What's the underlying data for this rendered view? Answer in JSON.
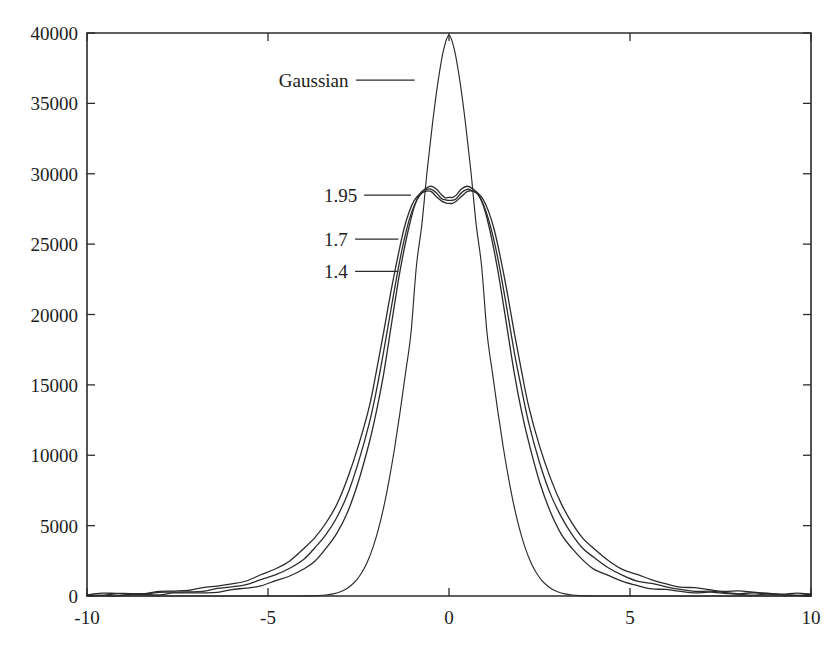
{
  "chart_data": {
    "type": "line",
    "title": "",
    "subtitle": "",
    "xlabel": "",
    "ylabel": "",
    "xlim": [
      -10,
      10
    ],
    "ylim": [
      0,
      40000
    ],
    "grid": false,
    "legend_position": "inline-annotations",
    "xticks": [
      -10,
      -5,
      0,
      5,
      10
    ],
    "xtick_labels": [
      "-10",
      "-5",
      "0",
      "5",
      "10"
    ],
    "yticks": [
      0,
      5000,
      10000,
      15000,
      20000,
      25000,
      30000,
      35000,
      40000
    ],
    "ytick_labels": [
      "0",
      "5000",
      "10000",
      "15000",
      "20000",
      "25000",
      "30000",
      "35000",
      "40000"
    ],
    "annotations": [
      {
        "text": "Gaussian",
        "label_x": -4.7,
        "label_y": 36650,
        "leader_to_x": -0.95,
        "leader_to_y": 36650
      },
      {
        "text": "1.95",
        "label_x": -3.45,
        "label_y": 28480,
        "leader_to_x": -1.05,
        "leader_to_y": 28480
      },
      {
        "text": "1.7",
        "label_x": -3.45,
        "label_y": 25350,
        "leader_to_x": -1.4,
        "leader_to_y": 25350
      },
      {
        "text": "1.4",
        "label_x": -3.45,
        "label_y": 23070,
        "leader_to_x": -1.4,
        "leader_to_y": 23070
      }
    ],
    "series": [
      {
        "name": "Gaussian",
        "peak": 39850,
        "x": [
          -10.0,
          -9.5,
          -9.0,
          -8.5,
          -8.0,
          -7.5,
          -7.0,
          -6.5,
          -6.0,
          -5.5,
          -5.0,
          -4.6,
          -4.2,
          -3.9,
          -3.6,
          -3.4,
          -3.2,
          -3.0,
          -2.85,
          -2.7,
          -2.55,
          -2.4,
          -2.25,
          -2.1,
          -1.95,
          -1.8,
          -1.65,
          -1.5,
          -1.35,
          -1.2,
          -1.05,
          -0.9,
          -0.75,
          -0.6,
          -0.45,
          -0.3,
          -0.15,
          0.0,
          0.15,
          0.3,
          0.45,
          0.6,
          0.75,
          0.9,
          1.05,
          1.2,
          1.35,
          1.5,
          1.65,
          1.8,
          1.95,
          2.1,
          2.25,
          2.4,
          2.55,
          2.7,
          2.85,
          3.0,
          3.2,
          3.4,
          3.6,
          3.9,
          4.2,
          4.6,
          5.0,
          5.5,
          6.0,
          6.5,
          7.0,
          7.5,
          8.0,
          8.5,
          9.0,
          9.5,
          10.0
        ],
        "y": [
          0,
          0,
          0,
          0,
          0,
          0,
          0,
          0,
          0,
          0,
          0,
          0,
          0,
          10,
          30,
          70,
          150,
          300,
          480,
          760,
          1150,
          1700,
          2450,
          3450,
          4750,
          6350,
          8300,
          10550,
          13100,
          15850,
          18700,
          23450,
          26400,
          30300,
          33700,
          36600,
          38800,
          39850,
          38800,
          36600,
          33700,
          30300,
          26400,
          23450,
          18700,
          15850,
          13100,
          10550,
          8300,
          6350,
          4750,
          3450,
          2450,
          1700,
          1150,
          760,
          480,
          300,
          150,
          70,
          30,
          10,
          0,
          0,
          0,
          0,
          0,
          0,
          0,
          0,
          0,
          0,
          0,
          0,
          0
        ]
      },
      {
        "name": "1.95",
        "peak": 29100,
        "center_dip": 28300,
        "x": [
          -10.0,
          -9.6,
          -9.2,
          -8.8,
          -8.4,
          -8.0,
          -7.6,
          -7.2,
          -6.8,
          -6.4,
          -6.0,
          -5.6,
          -5.2,
          -4.8,
          -4.4,
          -4.0,
          -3.7,
          -3.4,
          -3.1,
          -2.8,
          -2.5,
          -2.2,
          -2.0,
          -1.8,
          -1.6,
          -1.4,
          -1.25,
          -1.1,
          -0.95,
          -0.8,
          -0.65,
          -0.5,
          -0.35,
          -0.2,
          -0.1,
          0.0,
          0.1,
          0.2,
          0.35,
          0.5,
          0.65,
          0.8,
          0.95,
          1.1,
          1.25,
          1.4,
          1.6,
          1.8,
          2.0,
          2.2,
          2.5,
          2.8,
          3.1,
          3.4,
          3.7,
          4.0,
          4.4,
          4.8,
          5.2,
          5.6,
          6.0,
          6.4,
          6.8,
          7.2,
          7.6,
          8.0,
          8.4,
          8.8,
          9.2,
          9.6,
          10.0
        ],
        "y": [
          60,
          70,
          80,
          90,
          110,
          130,
          160,
          200,
          250,
          320,
          420,
          560,
          760,
          1020,
          1400,
          1950,
          2550,
          3350,
          4450,
          6000,
          8100,
          10900,
          13200,
          15900,
          19100,
          22400,
          24500,
          26300,
          27700,
          28600,
          28950,
          29100,
          28900,
          28500,
          28320,
          28300,
          28320,
          28500,
          28900,
          29100,
          28950,
          28600,
          27700,
          26300,
          24500,
          22400,
          19100,
          15900,
          13200,
          10900,
          8100,
          6000,
          4450,
          3350,
          2550,
          1950,
          1400,
          1020,
          760,
          560,
          420,
          320,
          250,
          200,
          160,
          130,
          110,
          90,
          80,
          70,
          60
        ]
      },
      {
        "name": "1.7",
        "peak": 28900,
        "center_dip": 28100,
        "x": [
          -10.0,
          -9.6,
          -9.2,
          -8.8,
          -8.4,
          -8.0,
          -7.6,
          -7.2,
          -6.8,
          -6.4,
          -6.0,
          -5.6,
          -5.2,
          -4.8,
          -4.4,
          -4.0,
          -3.7,
          -3.4,
          -3.1,
          -2.8,
          -2.5,
          -2.2,
          -2.0,
          -1.8,
          -1.6,
          -1.4,
          -1.25,
          -1.1,
          -0.95,
          -0.8,
          -0.65,
          -0.5,
          -0.35,
          -0.2,
          -0.1,
          0.0,
          0.1,
          0.2,
          0.35,
          0.5,
          0.65,
          0.8,
          0.95,
          1.1,
          1.25,
          1.4,
          1.6,
          1.8,
          2.0,
          2.2,
          2.5,
          2.8,
          3.1,
          3.4,
          3.7,
          4.0,
          4.4,
          4.8,
          5.2,
          5.6,
          6.0,
          6.4,
          6.8,
          7.2,
          7.6,
          8.0,
          8.4,
          8.8,
          9.2,
          9.6,
          10.0
        ],
        "y": [
          90,
          100,
          120,
          140,
          170,
          200,
          250,
          310,
          390,
          490,
          640,
          840,
          1100,
          1470,
          1980,
          2680,
          3400,
          4350,
          5600,
          7300,
          9500,
          12300,
          14700,
          17400,
          20400,
          23300,
          25200,
          26700,
          27800,
          28500,
          28800,
          28900,
          28650,
          28250,
          28130,
          28100,
          28130,
          28250,
          28650,
          28900,
          28800,
          28500,
          27800,
          26700,
          25200,
          23300,
          20400,
          17400,
          14700,
          12300,
          9500,
          7300,
          5600,
          4350,
          3400,
          2680,
          1980,
          1470,
          1100,
          840,
          640,
          490,
          390,
          310,
          250,
          200,
          170,
          140,
          120,
          100,
          90
        ]
      },
      {
        "name": "1.4",
        "peak": 28750,
        "center_dip": 27900,
        "x": [
          -10.0,
          -9.6,
          -9.2,
          -8.8,
          -8.4,
          -8.0,
          -7.6,
          -7.2,
          -6.8,
          -6.4,
          -6.0,
          -5.6,
          -5.2,
          -4.8,
          -4.4,
          -4.0,
          -3.7,
          -3.4,
          -3.1,
          -2.8,
          -2.5,
          -2.2,
          -2.0,
          -1.8,
          -1.6,
          -1.4,
          -1.25,
          -1.1,
          -0.95,
          -0.8,
          -0.65,
          -0.5,
          -0.35,
          -0.2,
          -0.1,
          0.0,
          0.1,
          0.2,
          0.35,
          0.5,
          0.65,
          0.8,
          0.95,
          1.1,
          1.25,
          1.4,
          1.6,
          1.8,
          2.0,
          2.2,
          2.5,
          2.8,
          3.1,
          3.4,
          3.7,
          4.0,
          4.4,
          4.8,
          5.2,
          5.6,
          6.0,
          6.4,
          6.8,
          7.2,
          7.6,
          8.0,
          8.4,
          8.8,
          9.2,
          9.6,
          10.0
        ],
        "y": [
          130,
          150,
          175,
          205,
          245,
          295,
          360,
          440,
          545,
          690,
          880,
          1130,
          1470,
          1920,
          2530,
          3350,
          4150,
          5200,
          6550,
          8350,
          10700,
          13500,
          16000,
          18800,
          21700,
          24300,
          26000,
          27300,
          28150,
          28600,
          28740,
          28750,
          28400,
          28030,
          27930,
          27900,
          27930,
          28030,
          28400,
          28750,
          28740,
          28600,
          28150,
          27300,
          26000,
          24300,
          21700,
          18800,
          16000,
          13500,
          10700,
          8350,
          6550,
          5200,
          4150,
          3350,
          2530,
          1920,
          1470,
          1130,
          880,
          690,
          545,
          440,
          360,
          295,
          245,
          205,
          175,
          150,
          130
        ]
      }
    ]
  },
  "plot_geometry": {
    "left": 87,
    "right": 811,
    "top": 33,
    "bottom": 596
  },
  "style": {
    "line_color": "#2b2b2b",
    "axis_color": "#2b2b2b",
    "background": "#ffffff",
    "text_color": "#1d1d1d"
  }
}
